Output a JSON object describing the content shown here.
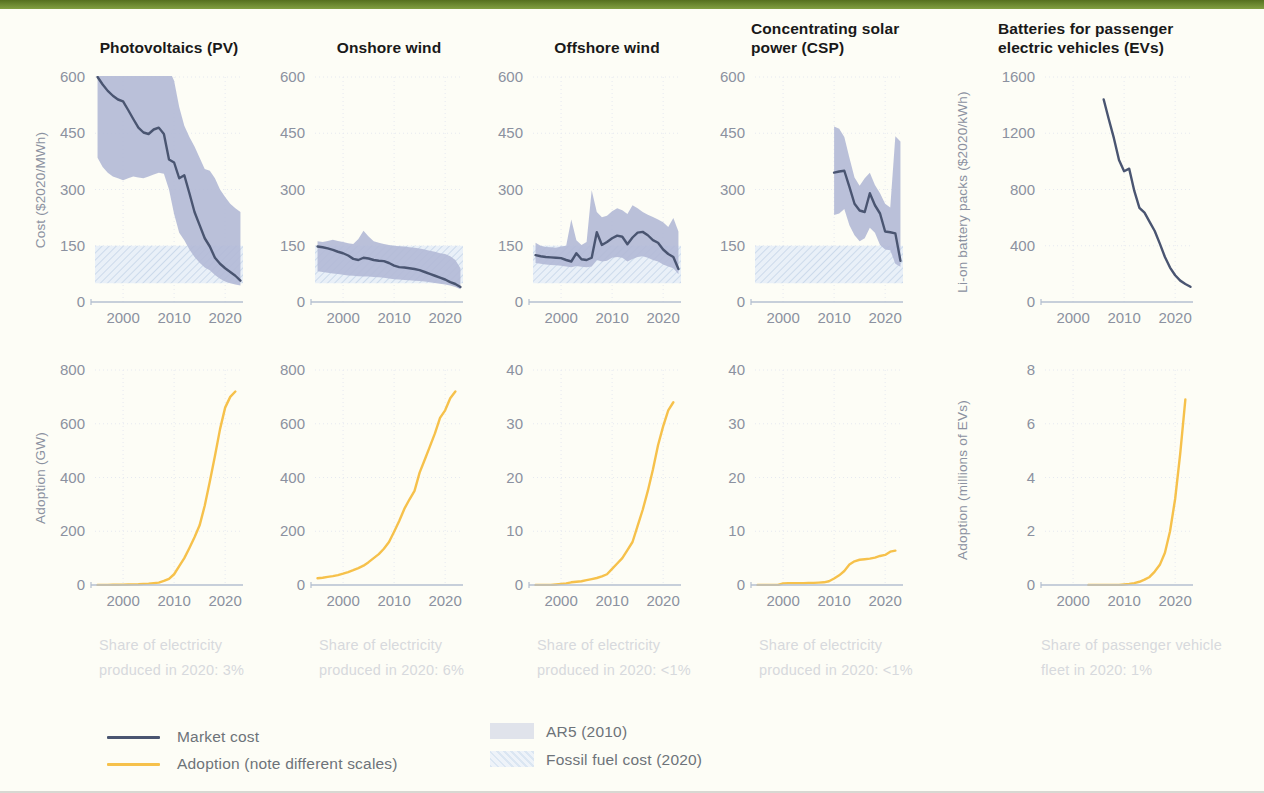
{
  "palette": {
    "top_bar": "#6f8c33",
    "background": "#fdfdf6",
    "market_cost_line": "#4a5571",
    "adoption_line": "#f6c14b",
    "ar5_band": "#b3b9d6",
    "fossil_band_base": "#e9f0f8",
    "fossil_band_hatch": "#ccdaeb",
    "tick_text": "#8b91a0",
    "grid": "#e6e9f0",
    "baseline": "#b4bfd1",
    "title_text": "#191919",
    "caption_text": "#d7d9dd",
    "legend_text": "#6d7379"
  },
  "axis_labels": {
    "cost": "Cost ($2020/MWh)",
    "battery": "Li-on battery packs ($2020/kWh)",
    "adoption_gw": "Adoption (GW)",
    "adoption_ev": "Adoption (millions of EVs)"
  },
  "legend": {
    "market_cost": "Market cost",
    "adoption": "Adoption (note different scales)",
    "ar5": "AR5 (2010)",
    "fossil": "Fossil fuel cost (2020)"
  },
  "captions": [
    "Share of electricity produced in 2020: 3%",
    "Share of electricity produced in 2020: 6%",
    "Share of electricity produced in 2020: <1%",
    "Share of electricity produced in 2020: <1%",
    "Share of passenger vehicle fleet in 2020: 1%"
  ],
  "chart_data": [
    {
      "type": "line",
      "title": "Photovoltaics (PV)",
      "ylabel": "Cost ($2020/MWh)",
      "ylim": [
        0,
        600
      ],
      "yticks": [
        0,
        150,
        300,
        450,
        600
      ],
      "xlim": [
        1994.5,
        2023.5
      ],
      "xticks": [
        2000,
        2010,
        2020
      ],
      "fossil_band": [
        50,
        150
      ],
      "band": {
        "x_start": 1995,
        "x_step": 1,
        "top": [
          640,
          640,
          640,
          640,
          640,
          640,
          640,
          640,
          640,
          640,
          640,
          640,
          640,
          640,
          620,
          590,
          520,
          470,
          440,
          415,
          385,
          355,
          350,
          330,
          300,
          280,
          262,
          250,
          240
        ],
        "bottom": [
          385,
          360,
          345,
          335,
          330,
          325,
          330,
          335,
          332,
          330,
          335,
          340,
          345,
          342,
          300,
          235,
          185,
          165,
          140,
          120,
          105,
          92,
          85,
          72,
          62,
          55,
          50,
          47,
          44
        ]
      },
      "line": {
        "x_start": 1995,
        "x_step": 1,
        "values": [
          600,
          580,
          563,
          550,
          540,
          535,
          512,
          488,
          465,
          452,
          448,
          460,
          465,
          448,
          380,
          372,
          330,
          338,
          290,
          240,
          205,
          170,
          148,
          118,
          102,
          90,
          80,
          70,
          57
        ]
      }
    },
    {
      "type": "line",
      "title": "Onshore wind",
      "ylim": [
        0,
        600
      ],
      "yticks": [
        0,
        150,
        300,
        450,
        600
      ],
      "xlim": [
        1994.5,
        2023.5
      ],
      "xticks": [
        2000,
        2010,
        2020
      ],
      "fossil_band": [
        50,
        150
      ],
      "band": {
        "x_start": 1995,
        "x_step": 1,
        "top": [
          162,
          160,
          163,
          166,
          163,
          160,
          157,
          155,
          168,
          190,
          175,
          162,
          158,
          155,
          152,
          150,
          149,
          148,
          146,
          145,
          143,
          140,
          137,
          134,
          130,
          128,
          122,
          112,
          90
        ],
        "bottom": [
          82,
          80,
          78,
          76,
          75,
          73,
          71,
          70,
          69,
          68,
          68,
          67,
          66,
          65,
          63,
          61,
          60,
          59,
          58,
          57,
          56,
          55,
          53,
          51,
          49,
          47,
          44,
          40,
          34
        ]
      },
      "line": {
        "x_start": 1995,
        "x_step": 1,
        "values": [
          148,
          146,
          143,
          139,
          134,
          130,
          124,
          115,
          112,
          118,
          116,
          112,
          110,
          109,
          104,
          97,
          93,
          92,
          90,
          88,
          85,
          80,
          75,
          70,
          65,
          60,
          53,
          48,
          40
        ]
      }
    },
    {
      "type": "line",
      "title": "Offshore wind",
      "ylim": [
        0,
        600
      ],
      "yticks": [
        0,
        150,
        300,
        450,
        600
      ],
      "xlim": [
        1994.5,
        2023.5
      ],
      "xticks": [
        2000,
        2010,
        2020
      ],
      "fossil_band": [
        50,
        150
      ],
      "band": {
        "x_start": 1995,
        "x_step": 1,
        "top": [
          158,
          150,
          147,
          146,
          145,
          148,
          150,
          220,
          165,
          152,
          160,
          298,
          240,
          226,
          230,
          242,
          250,
          245,
          235,
          258,
          250,
          240,
          233,
          227,
          220,
          213,
          200,
          224,
          188
        ],
        "bottom": [
          104,
          102,
          100,
          99,
          98,
          97,
          95,
          93,
          96,
          94,
          93,
          95,
          112,
          108,
          110,
          118,
          120,
          118,
          108,
          115,
          120,
          122,
          118,
          112,
          108,
          100,
          95,
          90,
          74
        ]
      },
      "line": {
        "x_start": 1995,
        "x_step": 1,
        "values": [
          125,
          122,
          120,
          119,
          118,
          117,
          112,
          108,
          130,
          114,
          112,
          118,
          186,
          152,
          160,
          170,
          177,
          174,
          154,
          172,
          185,
          187,
          178,
          165,
          158,
          140,
          128,
          120,
          88
        ]
      }
    },
    {
      "type": "line",
      "title": "Concentrating solar power (CSP)",
      "ylim": [
        0,
        600
      ],
      "yticks": [
        0,
        150,
        300,
        450,
        600
      ],
      "xlim": [
        1994.5,
        2023.5
      ],
      "xticks": [
        2000,
        2010,
        2020
      ],
      "fossil_band": [
        50,
        150
      ],
      "band": {
        "x_start": 2010,
        "x_step": 1,
        "top": [
          468,
          462,
          440,
          385,
          332,
          310,
          330,
          345,
          312,
          290,
          262,
          252,
          442,
          428
        ],
        "bottom": [
          232,
          236,
          248,
          205,
          178,
          162,
          170,
          198,
          185,
          152,
          140,
          138,
          102,
          94
        ]
      },
      "line": {
        "x_start": 2010,
        "x_step": 1,
        "values": [
          345,
          348,
          350,
          307,
          262,
          244,
          240,
          290,
          258,
          236,
          188,
          186,
          183,
          110
        ]
      }
    },
    {
      "type": "line",
      "title": "Batteries for passenger electric vehicles (EVs)",
      "ylabel": "Li-on battery packs ($2020/kWh)",
      "ylim": [
        0,
        1600
      ],
      "yticks": [
        0,
        400,
        800,
        1200,
        1600
      ],
      "xlim": [
        1994.5,
        2023.5
      ],
      "xticks": [
        2000,
        2010,
        2020
      ],
      "line": {
        "x_start": 2006,
        "x_step": 1,
        "values": [
          1440,
          1300,
          1165,
          1010,
          930,
          948,
          790,
          670,
          635,
          570,
          505,
          415,
          320,
          245,
          190,
          152,
          128,
          108
        ]
      }
    },
    {
      "type": "line",
      "title": "Photovoltaics (PV) adoption",
      "ylabel": "Adoption (GW)",
      "ylim": [
        0,
        800
      ],
      "yticks": [
        0,
        200,
        400,
        600,
        800
      ],
      "xlim": [
        1994.5,
        2023.5
      ],
      "xticks": [
        2000,
        2010,
        2020
      ],
      "line": {
        "x_start": 1995,
        "x_step": 1,
        "values": [
          0.3,
          0.4,
          0.5,
          0.7,
          1,
          1.5,
          2,
          2.5,
          3,
          4,
          5,
          7,
          9,
          15,
          23,
          40,
          70,
          100,
          138,
          178,
          222,
          295,
          385,
          480,
          580,
          660,
          700,
          720
        ]
      }
    },
    {
      "type": "line",
      "title": "Onshore wind adoption",
      "ylim": [
        0,
        800
      ],
      "yticks": [
        0,
        200,
        400,
        600,
        800
      ],
      "xlim": [
        1994.5,
        2023.5
      ],
      "xticks": [
        2000,
        2010,
        2020
      ],
      "line": {
        "x_start": 1995,
        "x_step": 1,
        "values": [
          25,
          27,
          30,
          33,
          37,
          42,
          48,
          55,
          63,
          72,
          85,
          100,
          115,
          135,
          160,
          198,
          238,
          283,
          318,
          350,
          418,
          466,
          515,
          564,
          622,
          650,
          695,
          720
        ]
      }
    },
    {
      "type": "line",
      "title": "Offshore wind adoption",
      "ylim": [
        0,
        40
      ],
      "yticks": [
        0,
        10,
        20,
        30,
        40
      ],
      "xlim": [
        1994.5,
        2023.5
      ],
      "xticks": [
        2000,
        2010,
        2020
      ],
      "line": {
        "x_start": 1995,
        "x_step": 1,
        "values": [
          0,
          0,
          0,
          0,
          0.1,
          0.2,
          0.3,
          0.5,
          0.6,
          0.7,
          0.9,
          1.1,
          1.3,
          1.6,
          2,
          3,
          4,
          5,
          6.5,
          8,
          11,
          14,
          17.5,
          21.5,
          26,
          29.5,
          32.5,
          34
        ]
      }
    },
    {
      "type": "line",
      "title": "Concentrating solar power (CSP) adoption",
      "ylim": [
        0,
        40
      ],
      "yticks": [
        0,
        10,
        20,
        30,
        40
      ],
      "xlim": [
        1994.5,
        2023.5
      ],
      "xticks": [
        2000,
        2010,
        2020
      ],
      "line": {
        "x_start": 1995,
        "x_step": 1,
        "values": [
          0,
          0,
          0,
          0,
          0,
          0.3,
          0.35,
          0.35,
          0.35,
          0.35,
          0.4,
          0.4,
          0.45,
          0.5,
          0.7,
          1.2,
          1.8,
          2.6,
          3.8,
          4.4,
          4.7,
          4.8,
          4.9,
          5.1,
          5.4,
          5.6,
          6.2,
          6.4
        ]
      }
    },
    {
      "type": "line",
      "title": "EV adoption",
      "ylabel": "Adoption (millions of EVs)",
      "ylim": [
        0,
        8
      ],
      "yticks": [
        0,
        2,
        4,
        6,
        8
      ],
      "xlim": [
        1994.5,
        2023.5
      ],
      "xticks": [
        2000,
        2010,
        2020
      ],
      "line": {
        "x_start": 2003,
        "x_step": 1,
        "values": [
          0,
          0,
          0,
          0,
          0,
          0,
          0,
          0.02,
          0.04,
          0.07,
          0.12,
          0.2,
          0.3,
          0.5,
          0.75,
          1.2,
          2.0,
          3.2,
          4.9,
          6.9
        ]
      }
    }
  ]
}
